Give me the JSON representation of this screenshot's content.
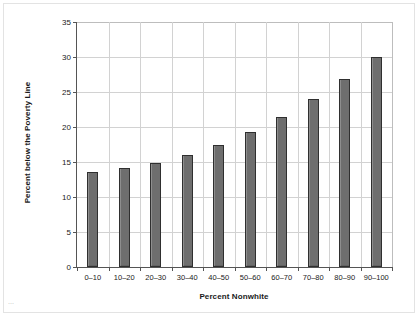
{
  "chart_data": {
    "type": "bar",
    "title": "",
    "xlabel": "Percent Nonwhite",
    "ylabel": "Percent below the Poverty Line",
    "categories": [
      "0–10",
      "10–20",
      "20–30",
      "30–40",
      "40–50",
      "50–60",
      "60–70",
      "70–80",
      "80–90",
      "90–100"
    ],
    "values": [
      13.6,
      14.1,
      14.9,
      16.0,
      17.5,
      19.3,
      21.4,
      24.0,
      26.8,
      30.0
    ],
    "ylim": [
      0,
      35
    ],
    "ytick_labels": [
      "0",
      "5",
      "10",
      "15",
      "20",
      "25",
      "30",
      "35"
    ],
    "ytick_values": [
      0,
      5,
      10,
      15,
      20,
      25,
      30,
      35
    ],
    "grid": "both",
    "legend": "none",
    "bar_color": "#6e6e6e",
    "bar_edge_color": "#2f2f2f",
    "grid_color": "#d2d2d2",
    "axis_color": "#555555",
    "background_color": "#ffffff"
  },
  "artifact": {
    "mark": "⋯"
  }
}
